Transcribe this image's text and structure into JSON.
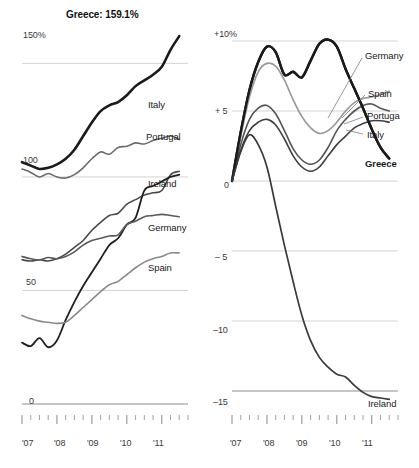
{
  "figure": {
    "width": 419,
    "height": 468,
    "background": "#ffffff"
  },
  "panels": {
    "debt": {
      "title": "Greece: 159.1%",
      "y_ticks": [
        "150%",
        "100",
        "50",
        "0"
      ],
      "x_ticks": [
        "'07",
        "'08",
        "'09",
        "'10",
        "'11"
      ],
      "series_labels": [
        "Italy",
        "Portugal",
        "Ireland",
        "Germany",
        "Spain"
      ]
    },
    "gdp": {
      "title": "",
      "y_ticks": [
        "+10%",
        "+ 5",
        "0",
        "– 5",
        "–10",
        "–15"
      ],
      "x_ticks": [
        "'07",
        "'08",
        "'09",
        "'10",
        "'11"
      ],
      "series_labels": [
        "Germany",
        "Spain",
        "Portuga",
        "Italy",
        "Greece",
        "Ireland"
      ]
    }
  },
  "chart_data": [
    {
      "id": "debt",
      "type": "line",
      "title": "Greece: 159.1%",
      "xlabel": "",
      "ylabel": "",
      "annotation": "Greece: 159.1%",
      "ylim": [
        0,
        170
      ],
      "xlim": [
        2007.0,
        2011.75
      ],
      "yticks": [
        0,
        50,
        100,
        150
      ],
      "ytick_labels": [
        "0",
        "50",
        "100",
        "150%"
      ],
      "xticks": [
        2007,
        2008,
        2009,
        2010,
        2011
      ],
      "xtick_labels": [
        "'07",
        "'08",
        "'09",
        "'10",
        "'11"
      ],
      "grid": "horizontal",
      "legend_position": "right-inline",
      "x": [
        2007.0,
        2007.25,
        2007.5,
        2007.75,
        2008.0,
        2008.25,
        2008.5,
        2008.75,
        2009.0,
        2009.25,
        2009.5,
        2009.75,
        2010.0,
        2010.25,
        2010.5,
        2010.75,
        2011.0,
        2011.25,
        2011.5
      ],
      "series": [
        {
          "name": "Greece",
          "color": "#1a1a1a",
          "width": 2.6,
          "values": [
            106.5,
            105.0,
            103.5,
            104.0,
            105.5,
            108.0,
            112.0,
            118.0,
            124.0,
            129.0,
            131.5,
            133.0,
            136.0,
            140.0,
            142.5,
            145.0,
            148.5,
            156.0,
            162.0
          ]
        },
        {
          "name": "Italy",
          "color": "#6b6b6b",
          "width": 1.6,
          "values": [
            103.5,
            102.0,
            100.0,
            101.5,
            100.0,
            99.5,
            101.0,
            104.0,
            108.0,
            111.0,
            110.0,
            113.0,
            113.5,
            115.0,
            114.5,
            116.0,
            117.0,
            118.0,
            116.5
          ]
        },
        {
          "name": "Portugal",
          "color": "#4a4a4a",
          "width": 1.6,
          "values": [
            63.5,
            63.0,
            63.5,
            63.0,
            64.0,
            66.0,
            69.0,
            72.0,
            76.5,
            80.0,
            83.0,
            84.0,
            88.0,
            90.0,
            92.0,
            93.0,
            94.0,
            101.0,
            102.5
          ]
        },
        {
          "name": "Ireland",
          "color": "#1f1f1f",
          "width": 1.8,
          "values": [
            27.0,
            25.5,
            29.0,
            25.0,
            28.0,
            37.0,
            45.0,
            52.0,
            58.0,
            64.0,
            70.0,
            73.0,
            79.0,
            82.0,
            94.0,
            96.0,
            98.0,
            100.0,
            101.0
          ]
        },
        {
          "name": "Germany",
          "color": "#5a5a5a",
          "width": 1.6,
          "values": [
            65.0,
            64.0,
            63.5,
            64.5,
            64.0,
            65.0,
            67.0,
            70.0,
            72.0,
            73.0,
            74.0,
            74.5,
            79.0,
            80.5,
            82.5,
            83.0,
            83.5,
            83.0,
            82.5
          ]
        },
        {
          "name": "Spain",
          "color": "#8a8a8a",
          "width": 1.6,
          "values": [
            39.0,
            37.5,
            36.5,
            36.0,
            35.5,
            36.0,
            39.0,
            42.5,
            46.0,
            49.5,
            52.5,
            54.0,
            57.0,
            60.0,
            62.5,
            64.0,
            65.0,
            66.5,
            66.5
          ]
        }
      ]
    },
    {
      "id": "gdp",
      "type": "line",
      "title": "",
      "xlabel": "",
      "ylabel": "",
      "ylim": [
        -16.5,
        11.5
      ],
      "xlim": [
        2007.0,
        2011.75
      ],
      "yticks": [
        10,
        5,
        0,
        -5,
        -10,
        -15
      ],
      "ytick_labels": [
        "+10%",
        "+ 5",
        "0",
        "– 5",
        "–10",
        "–15"
      ],
      "xticks": [
        2007,
        2008,
        2009,
        2010,
        2011
      ],
      "xtick_labels": [
        "'07",
        "'08",
        "'09",
        "'10",
        "'11"
      ],
      "grid": "horizontal",
      "legend_position": "right-inline",
      "x": [
        2007.0,
        2007.25,
        2007.5,
        2007.75,
        2008.0,
        2008.25,
        2008.5,
        2008.75,
        2009.0,
        2009.25,
        2009.5,
        2009.75,
        2010.0,
        2010.25,
        2010.5,
        2010.75,
        2011.0,
        2011.25,
        2011.5
      ],
      "series": [
        {
          "name": "Germany",
          "color": "#1a1a1a",
          "width": 2.4,
          "values": [
            0.0,
            3.5,
            6.5,
            8.5,
            9.6,
            9.2,
            7.6,
            7.8,
            7.4,
            8.6,
            9.8,
            10.1,
            9.6,
            8.0,
            6.6,
            5.2,
            3.7,
            2.4,
            1.6
          ]
        },
        {
          "name": "Spain",
          "color": "#9a9a9a",
          "width": 1.7,
          "values": [
            0.0,
            3.2,
            6.0,
            7.8,
            8.4,
            8.2,
            7.2,
            5.8,
            4.6,
            3.8,
            3.4,
            3.6,
            4.2,
            5.0,
            5.6,
            5.9,
            6.0,
            6.2,
            6.4
          ]
        },
        {
          "name": "Portugal",
          "color": "#555555",
          "width": 1.6,
          "values": [
            0.0,
            2.6,
            4.4,
            5.2,
            5.4,
            4.8,
            3.6,
            2.3,
            1.5,
            1.2,
            1.5,
            2.4,
            3.6,
            4.4,
            5.0,
            5.4,
            5.5,
            5.2,
            5.0
          ]
        },
        {
          "name": "Italy",
          "color": "#3f3f3f",
          "width": 1.6,
          "values": [
            0.0,
            2.2,
            3.6,
            4.2,
            4.4,
            4.0,
            3.0,
            1.8,
            1.0,
            0.7,
            1.0,
            1.8,
            2.6,
            3.2,
            3.8,
            4.1,
            4.3,
            4.3,
            4.2
          ]
        },
        {
          "name": "Greece",
          "color": "#1a1a1a",
          "width": 2.4,
          "values": [
            0.0,
            3.5,
            6.5,
            8.5,
            9.6,
            9.2,
            7.6,
            7.8,
            7.4,
            8.6,
            9.8,
            10.1,
            9.6,
            8.0,
            6.6,
            5.2,
            3.7,
            2.4,
            1.6
          ]
        },
        {
          "name": "Ireland",
          "color": "#3a3a3a",
          "width": 1.7,
          "values": [
            0.0,
            2.1,
            3.3,
            2.6,
            1.0,
            -1.8,
            -4.6,
            -7.2,
            -9.6,
            -11.4,
            -12.6,
            -13.3,
            -13.8,
            -14.0,
            -14.6,
            -15.1,
            -15.4,
            -15.5,
            -15.6
          ]
        }
      ]
    }
  ]
}
